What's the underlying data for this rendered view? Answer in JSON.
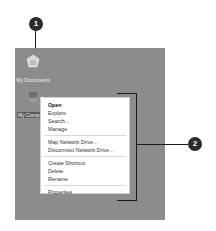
{
  "callouts": [
    {
      "number": "1"
    },
    {
      "number": "2"
    }
  ],
  "desktop": {
    "icons": [
      {
        "label": "My Documents",
        "icon": "my-documents-icon"
      },
      {
        "label": "My Computer",
        "icon": "my-computer-icon",
        "selected": true
      }
    ]
  },
  "context_menu": {
    "groups": [
      [
        "Open",
        "Explore",
        "Search...",
        "Manage"
      ],
      [
        "Map Network Drive...",
        "Disconnect Network Drive..."
      ],
      [
        "Create Shortcut",
        "Delete",
        "Rename"
      ],
      [
        "Properties"
      ]
    ]
  },
  "colors": {
    "desktop_bg": "#8c8c8c",
    "callout_bg": "#2b2b2b",
    "menu_bg": "#ffffff"
  }
}
